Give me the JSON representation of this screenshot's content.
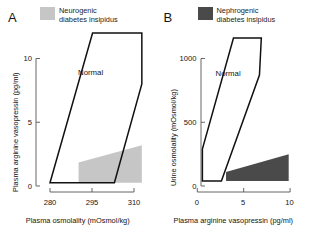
{
  "figure": {
    "panels": [
      {
        "letter": "A",
        "legend": {
          "label_line1": "Neurogenic",
          "label_line2": "diabetes insipidus",
          "color": "#c6c6c6"
        },
        "region_label": "Normal",
        "chart_data": {
          "type": "area",
          "title": "",
          "xlabel": "Plasma osmolality (mOsmol/kg)",
          "ylabel": "Plasma arginine vasopressin (pg/ml)",
          "xlim": [
            275,
            315
          ],
          "ylim": [
            0,
            12
          ],
          "xticks": [
            280,
            295,
            310
          ],
          "yticks": [
            0,
            5,
            10
          ],
          "xtick_labels": [
            "280",
            "295",
            "310"
          ],
          "ytick_labels": [
            "0",
            "5",
            "10"
          ],
          "grid": false,
          "legend_position": "top-right",
          "series": [
            {
              "name": "Normal",
              "kind": "polygon-outline",
              "fill": "none",
              "stroke": "#111111",
              "points": [
                [
                  280.0,
                  0.25
                ],
                [
                  295.2,
                  12.0
                ],
                [
                  312.8,
                  12.0
                ],
                [
                  312.8,
                  8.0
                ],
                [
                  303.0,
                  0.25
                ]
              ]
            },
            {
              "name": "Neurogenic diabetes insipidus",
              "kind": "polygon-fill",
              "fill": "#c6c6c6",
              "stroke": "none",
              "points": [
                [
                  290.2,
                  0.25
                ],
                [
                  290.2,
                  1.85
                ],
                [
                  312.8,
                  3.2
                ],
                [
                  312.8,
                  0.25
                ]
              ]
            }
          ]
        }
      },
      {
        "letter": "B",
        "legend": {
          "label_line1": "Nephrogenic",
          "label_line2": "diabetes insipidus",
          "color": "#4a4a4a"
        },
        "region_label": "Normal",
        "chart_data": {
          "type": "area",
          "title": "",
          "xlabel": "Plasma arginine vasopressin (pg/ml)",
          "ylabel": "Urine osmolality (mOsmol/kg)",
          "xlim": [
            -1.0,
            11.5
          ],
          "ylim": [
            0,
            1200
          ],
          "xticks": [
            0,
            5,
            10
          ],
          "yticks": [
            0,
            500,
            1000
          ],
          "xtick_labels": [
            "0",
            "5",
            "10"
          ],
          "ytick_labels": [
            "0",
            "500",
            "1000"
          ],
          "grid": false,
          "legend_position": "top-right",
          "series": [
            {
              "name": "Normal",
              "kind": "polygon-outline",
              "fill": "none",
              "stroke": "#111111",
              "points": [
                [
                  0.55,
                  40
                ],
                [
                  0.55,
                  290
                ],
                [
                  3.9,
                  1160
                ],
                [
                  6.9,
                  1160
                ],
                [
                  6.7,
                  870
                ],
                [
                  2.6,
                  40
                ]
              ]
            },
            {
              "name": "Nephrogenic diabetes insipidus",
              "kind": "polygon-fill",
              "fill": "#4a4a4a",
              "stroke": "none",
              "points": [
                [
                  3.1,
                  40
                ],
                [
                  3.1,
                  110
                ],
                [
                  9.85,
                  250
                ],
                [
                  9.85,
                  40
                ]
              ]
            }
          ]
        }
      }
    ]
  }
}
